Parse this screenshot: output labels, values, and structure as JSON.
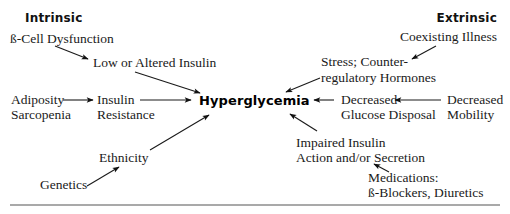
{
  "diagram": {
    "title": "Hyperglycemia",
    "sections": {
      "intrinsic": "Intrinsic",
      "extrinsic": "Extrinsic"
    },
    "nodes": {
      "beta_cell": "ß-Cell Dysfunction",
      "low_insulin": "Low or Altered Insulin",
      "adiposity_1": "Adiposity",
      "adiposity_2": "Sarcopenia",
      "insulin_res_1": "Insulin",
      "insulin_res_2": "Resistance",
      "ethnicity": "Ethnicity",
      "genetics": "Genetics",
      "coexisting": "Coexisting Illness",
      "stress_1": "Stress; Counter-",
      "stress_2": "regulatory Hormones",
      "dec_glucose_1": "Decreased",
      "dec_glucose_2": "Glucose Disposal",
      "dec_mobility_1": "Decreased",
      "dec_mobility_2": "Mobility",
      "impaired_1": "Impaired Insulin",
      "impaired_2": "Action and/or Secretion",
      "medications_1": "Medications:",
      "medications_2": "ß-Blockers, Diuretics"
    },
    "edges": [
      {
        "from": "ß-Cell Dysfunction",
        "to": "Low or Altered Insulin"
      },
      {
        "from": "Low or Altered Insulin",
        "to": "Hyperglycemia"
      },
      {
        "from": "Adiposity Sarcopenia",
        "to": "Insulin Resistance"
      },
      {
        "from": "Insulin Resistance",
        "to": "Hyperglycemia"
      },
      {
        "from": "Genetics",
        "to": "Ethnicity"
      },
      {
        "from": "Ethnicity",
        "to": "Hyperglycemia"
      },
      {
        "from": "Coexisting Illness",
        "to": "Stress; Counter-regulatory Hormones"
      },
      {
        "from": "Stress; Counter-regulatory Hormones",
        "to": "Hyperglycemia"
      },
      {
        "from": "Decreased Mobility",
        "to": "Decreased Glucose Disposal"
      },
      {
        "from": "Decreased Glucose Disposal",
        "to": "Hyperglycemia"
      },
      {
        "from": "Medications: ß-Blockers, Diuretics",
        "to": "Impaired Insulin Action and/or Secretion"
      },
      {
        "from": "Impaired Insulin Action and/or Secretion",
        "to": "Hyperglycemia"
      }
    ],
    "colors": {
      "text": "#1a1a1a",
      "arrow": "#1a1a1a",
      "rule": "#555555",
      "background": "#ffffff"
    }
  }
}
